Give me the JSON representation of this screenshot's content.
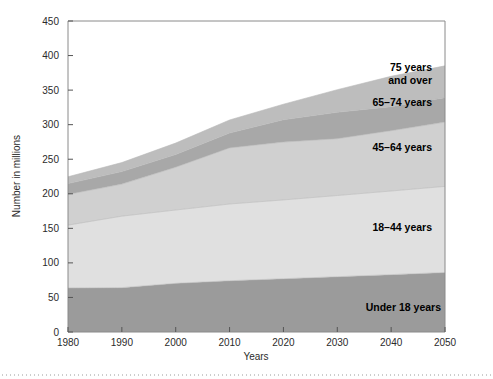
{
  "chart_data": {
    "type": "area",
    "stacked": true,
    "title": "",
    "subtitle": "",
    "xlabel": "Years",
    "ylabel": "Number in millions",
    "xlim": [
      1980,
      2050
    ],
    "ylim": [
      0,
      450
    ],
    "grid": false,
    "legend_position": "inline-annotations",
    "x": [
      1980,
      1990,
      2000,
      2010,
      2020,
      2030,
      2040,
      2050
    ],
    "xticks": [
      "1980",
      "1990",
      "2000",
      "2010",
      "2020",
      "2030",
      "2040",
      "2050"
    ],
    "yticks": [
      "0",
      "50",
      "100",
      "150",
      "200",
      "250",
      "300",
      "350",
      "400",
      "450"
    ],
    "series": [
      {
        "name": "Under 18 years",
        "label": "Under 18 years",
        "color": "#9b9b9b",
        "values": [
          63.7,
          64.2,
          70.4,
          74.2,
          77.1,
          80.0,
          83.0,
          86.1
        ]
      },
      {
        "name": "18-44 years",
        "label": "18–44 years",
        "color": "#e0e0e0",
        "values": [
          90.9,
          103.4,
          106.1,
          111.0,
          114.0,
          117.5,
          121.0,
          124.6
        ]
      },
      {
        "name": "45-64 years",
        "label": "45–64 years",
        "color": "#d0d0d0",
        "values": [
          44.5,
          46.4,
          61.9,
          81.2,
          83.7,
          82.2,
          87.3,
          93.0
        ]
      },
      {
        "name": "65-74 years",
        "label": "65–74 years",
        "color": "#a8a8a8",
        "values": [
          15.6,
          18.1,
          18.4,
          21.5,
          32.3,
          38.2,
          34.7,
          35.4
        ]
      },
      {
        "name": "75 years and over",
        "label": "75 years\nand over",
        "color": "#bdbdbd",
        "values": [
          9.9,
          13.1,
          16.6,
          18.9,
          22.5,
          32.7,
          44.0,
          46.0
        ]
      }
    ],
    "annotations": [
      {
        "text": "75 years",
        "x": 2035,
        "y": 398
      },
      {
        "text": "and over",
        "x": 2035,
        "y": 386
      },
      {
        "text": "65–74 years",
        "x": 2035,
        "y": 355
      },
      {
        "text": "45–64 years",
        "x": 2035,
        "y": 290
      },
      {
        "text": "18–44 years",
        "x": 2034,
        "y": 175
      },
      {
        "text": "Under 18 years",
        "x": 2036,
        "y": 58
      }
    ]
  },
  "axes": {
    "y_title": "Number in millions",
    "x_title": "Years",
    "y_tick_labels": [
      "450",
      "400",
      "350",
      "300",
      "250",
      "200",
      "150",
      "100",
      "50",
      "0"
    ],
    "x_tick_labels": [
      "1980",
      "1990",
      "2000",
      "2010",
      "2020",
      "2030",
      "2040",
      "2050"
    ]
  },
  "labels": {
    "s75_line1": "75 years",
    "s75_line2": "and over",
    "s6574": "65–74 years",
    "s4564": "45–64 years",
    "s1844": "18–44 years",
    "under18": "Under 18 years"
  },
  "colors": {
    "under18": "#9b9b9b",
    "age1844": "#e0e0e0",
    "age4564": "#d0d0d0",
    "age6574": "#a8a8a8",
    "age75plus": "#bdbdbd",
    "frame": "#8a8a8a",
    "text": "#2b2b2b",
    "background": "#ffffff"
  }
}
